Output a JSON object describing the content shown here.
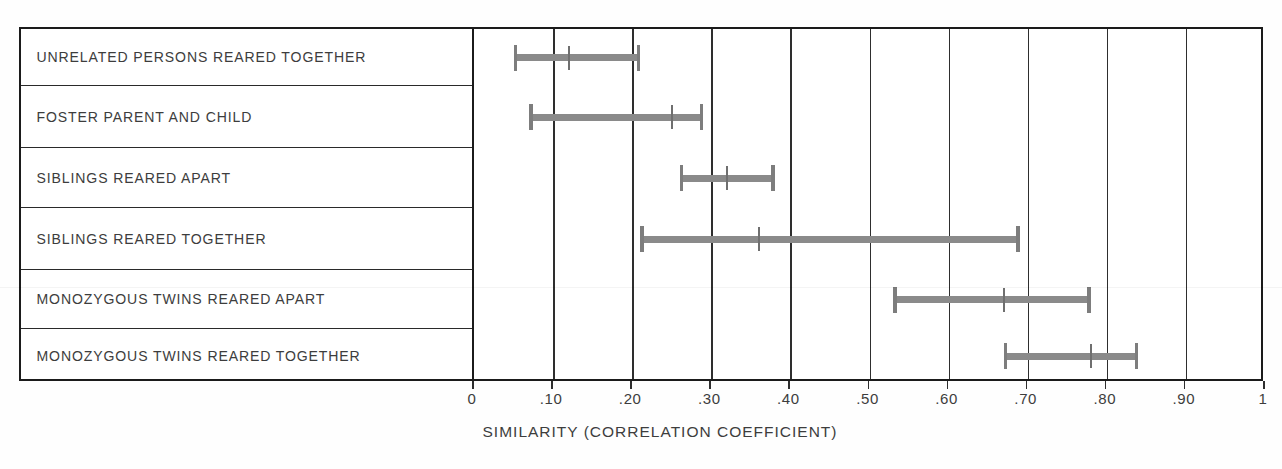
{
  "chart_data": {
    "type": "bar",
    "subtype": "range-bar-with-median",
    "title": "",
    "xlabel": "SIMILARITY (CORRELATION COEFFICIENT)",
    "ylabel": "",
    "xlim": [
      0,
      1
    ],
    "grid": true,
    "legend": null,
    "xticks": [
      0,
      0.1,
      0.2,
      0.3,
      0.4,
      0.5,
      0.6,
      0.7,
      0.8,
      0.9,
      1
    ],
    "xticklabels": [
      "0",
      ".10",
      ".20",
      ".30",
      ".40",
      ".50",
      ".60",
      ".70",
      ".80",
      ".90",
      "1"
    ],
    "categories": [
      "UNRELATED PERSONS REARED TOGETHER",
      "FOSTER PARENT AND CHILD",
      "SIBLINGS REARED APART",
      "SIBLINGS REARED TOGETHER",
      "MONOZYGOUS TWINS REARED APART",
      "MONOZYGOUS TWINS REARED TOGETHER"
    ],
    "series": [
      {
        "name": "range",
        "points": [
          {
            "category": "UNRELATED PERSONS REARED TOGETHER",
            "low": 0.05,
            "median": 0.12,
            "high": 0.21
          },
          {
            "category": "FOSTER PARENT AND CHILD",
            "low": 0.07,
            "median": 0.25,
            "high": 0.29
          },
          {
            "category": "SIBLINGS REARED APART",
            "low": 0.26,
            "median": 0.32,
            "high": 0.38
          },
          {
            "category": "SIBLINGS REARED TOGETHER",
            "low": 0.21,
            "median": 0.36,
            "high": 0.69
          },
          {
            "category": "MONOZYGOUS TWINS REARED APART",
            "low": 0.53,
            "median": 0.67,
            "high": 0.78
          },
          {
            "category": "MONOZYGOUS TWINS REARED TOGETHER",
            "low": 0.67,
            "median": 0.78,
            "high": 0.84
          }
        ]
      }
    ],
    "colors": {
      "bar": "#8a8a8a",
      "cap": "#7d7d7d",
      "median": "#6f6f6f",
      "line": "#2e2e2e",
      "text": "#3d3d3d",
      "background": "#ffffff"
    }
  },
  "axis": {
    "title": "SIMILARITY (CORRELATION COEFFICIENT)",
    "labels": [
      "0",
      ".10",
      ".20",
      ".30",
      ".40",
      ".50",
      ".60",
      ".70",
      ".80",
      ".90",
      "1"
    ]
  },
  "rows": [
    {
      "label": "UNRELATED PERSONS REARED TOGETHER"
    },
    {
      "label": "FOSTER PARENT AND CHILD"
    },
    {
      "label": "SIBLINGS REARED APART"
    },
    {
      "label": "SIBLINGS REARED TOGETHER"
    },
    {
      "label": "MONOZYGOUS TWINS REARED APART"
    },
    {
      "label": "MONOZYGOUS TWINS REARED TOGETHER"
    }
  ]
}
